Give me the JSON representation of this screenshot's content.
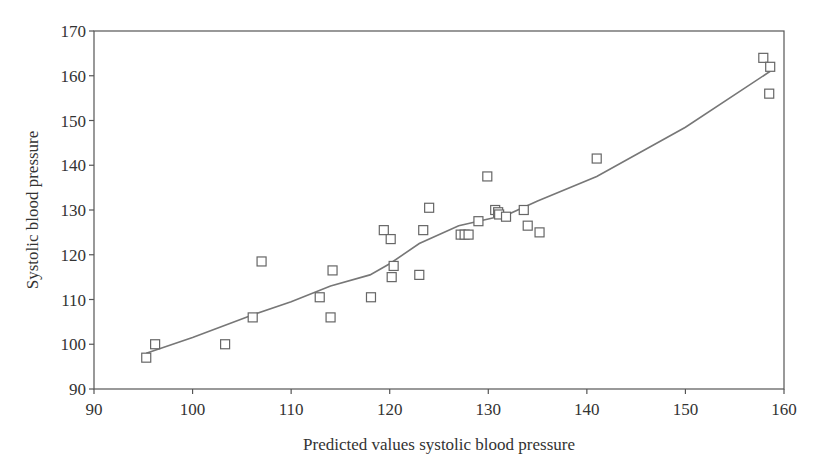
{
  "chart_data": {
    "type": "scatter",
    "title": "",
    "xlabel": "Predicted values systolic blood pressure",
    "ylabel": "Systolic blood pressure",
    "xlim": [
      90,
      160
    ],
    "ylim": [
      90,
      170
    ],
    "xticks": [
      90,
      100,
      110,
      120,
      130,
      140,
      150,
      160
    ],
    "yticks": [
      90,
      100,
      110,
      120,
      130,
      140,
      150,
      160,
      170
    ],
    "grid": false,
    "legend": null,
    "series": [
      {
        "name": "observed",
        "marker": "open-square",
        "points": [
          [
            95.3,
            97
          ],
          [
            96.2,
            100
          ],
          [
            103.3,
            100
          ],
          [
            106.1,
            106
          ],
          [
            107.0,
            118.5
          ],
          [
            112.9,
            110.5
          ],
          [
            114.0,
            106
          ],
          [
            114.2,
            116.5
          ],
          [
            118.1,
            110.5
          ],
          [
            119.4,
            125.5
          ],
          [
            120.1,
            123.5
          ],
          [
            120.2,
            115
          ],
          [
            120.4,
            117.5
          ],
          [
            123.0,
            115.5
          ],
          [
            123.4,
            125.5
          ],
          [
            124.0,
            130.5
          ],
          [
            127.2,
            124.5
          ],
          [
            127.6,
            124.5
          ],
          [
            128.0,
            124.5
          ],
          [
            129.0,
            127.5
          ],
          [
            129.9,
            137.5
          ],
          [
            130.7,
            130
          ],
          [
            131.0,
            129.5
          ],
          [
            131.1,
            129
          ],
          [
            131.8,
            128.5
          ],
          [
            133.6,
            130
          ],
          [
            134.0,
            126.5
          ],
          [
            135.2,
            125
          ],
          [
            141.0,
            141.5
          ],
          [
            157.9,
            164
          ],
          [
            158.6,
            162
          ],
          [
            158.5,
            156
          ]
        ]
      },
      {
        "name": "smoothed fit",
        "type": "line",
        "points": [
          [
            95.3,
            98
          ],
          [
            100,
            101.5
          ],
          [
            106,
            106.5
          ],
          [
            110,
            109.5
          ],
          [
            114,
            113
          ],
          [
            118,
            115.5
          ],
          [
            120,
            118
          ],
          [
            123,
            122.5
          ],
          [
            127,
            126.5
          ],
          [
            128,
            127
          ],
          [
            130,
            128
          ],
          [
            132,
            129
          ],
          [
            135,
            132
          ],
          [
            141,
            137.5
          ],
          [
            150,
            148.5
          ],
          [
            158.6,
            161
          ]
        ]
      }
    ]
  }
}
